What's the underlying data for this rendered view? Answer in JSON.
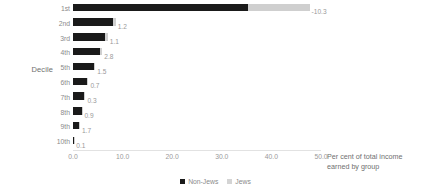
{
  "chart_data": {
    "type": "bar",
    "orientation": "horizontal",
    "title": "",
    "xlabel": "Per cent of total income earned by group",
    "ylabel": "Decile",
    "categories": [
      "1st",
      "2nd",
      "3rd",
      "4th",
      "5th",
      "6th",
      "7th",
      "8th",
      "9th",
      "10th"
    ],
    "xlim": [
      0.0,
      50.0
    ],
    "xticks": [
      "0.0",
      "10.0",
      "20.0",
      "30.0",
      "40.0",
      "50.0"
    ],
    "xtick_values": [
      0.0,
      10.0,
      20.0,
      30.0,
      40.0,
      50.0
    ],
    "grid": false,
    "legend_position": "bottom",
    "series": [
      {
        "name": "Non-Jews",
        "color": "#1a1a1a",
        "values": [
          35.2,
          8.0,
          6.5,
          5.5,
          4.2,
          2.9,
          2.3,
          1.8,
          1.3,
          0.2
        ],
        "labels": [
          "",
          "",
          "",
          "",
          "",
          "",
          "",
          "",
          "",
          ""
        ]
      },
      {
        "name": "Jews",
        "color": "#cfcfcf",
        "values": [
          12.5,
          0.6,
          0.5,
          0.4,
          0.3,
          0.2,
          0.2,
          0.1,
          0.1,
          0.05
        ],
        "labels": [
          "-10.3",
          "1.2",
          "1.1",
          "2.8",
          "1.5",
          "0.7",
          "0.3",
          "0.9",
          "1.7",
          "0.1"
        ]
      }
    ],
    "data_labels": [
      "-10.3",
      "1.2",
      "1.1",
      "2.8",
      "1.5",
      "0.7",
      "0.3",
      "0.9",
      "1.7",
      "0.1"
    ]
  },
  "axes": {
    "y_title": "Decile",
    "x_title_line1": "Per cent of total income",
    "x_title_line2": "earned by group"
  },
  "legend": {
    "items": [
      {
        "label": "Non-Jews",
        "color": "#1a1a1a"
      },
      {
        "label": "Jews",
        "color": "#d4d4d4"
      }
    ]
  }
}
